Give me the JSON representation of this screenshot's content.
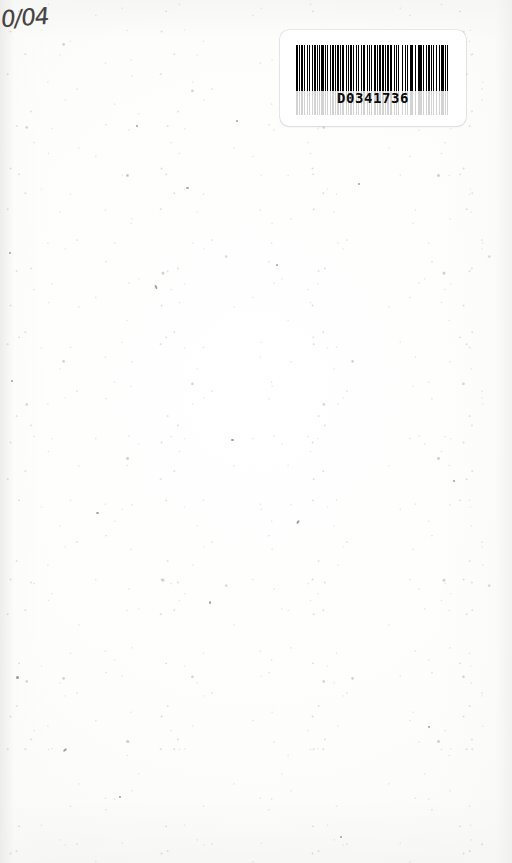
{
  "document": {
    "kind": "scanned-blank-page",
    "page_background_color": "#fdfdfc"
  },
  "annotation": {
    "handwritten_note": "0/04",
    "ink_color": "#2e2c2b"
  },
  "barcode_label": {
    "human_readable_number": "D0341736",
    "symbology": "Code 39",
    "bar_color": "#000000",
    "label_background_color": "#ffffff",
    "bar_pattern": [
      3,
      2,
      1,
      2,
      3,
      2,
      1,
      3,
      2,
      2,
      1,
      4,
      1,
      2,
      3,
      2,
      1,
      3,
      1,
      2,
      4,
      2,
      1,
      2,
      2,
      3,
      1,
      2,
      3,
      2,
      1,
      3,
      2,
      2,
      1,
      2,
      4,
      3,
      1,
      2,
      2,
      2,
      3,
      2,
      1,
      3,
      1,
      2,
      2,
      4,
      1,
      2,
      3,
      3,
      1,
      2,
      2,
      2,
      1,
      3,
      4,
      2,
      1,
      2,
      3,
      2,
      2,
      3,
      1,
      2,
      2,
      2,
      4,
      3,
      1,
      2,
      2,
      2,
      1,
      4,
      3,
      2,
      1,
      3,
      2,
      2,
      1,
      2,
      3,
      3,
      2,
      2,
      1,
      2,
      4,
      2,
      1,
      3,
      2,
      2,
      3,
      2,
      1,
      2,
      2,
      3,
      1,
      3,
      2,
      2,
      4,
      2,
      1,
      2,
      3,
      2,
      2,
      3,
      1,
      2,
      3,
      2,
      1,
      4,
      2,
      2,
      1,
      3
    ]
  }
}
